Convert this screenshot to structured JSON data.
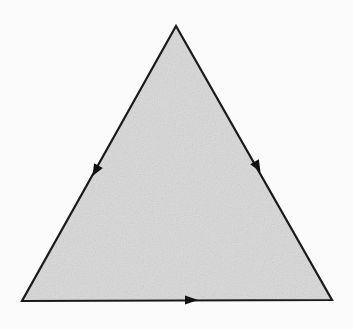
{
  "diagram": {
    "type": "triangle",
    "vertices": {
      "top": [
        176,
        26
      ],
      "bottom_left": [
        22,
        301
      ],
      "bottom_right": [
        332,
        300
      ]
    },
    "colors": {
      "background": "#fbfbfb",
      "fill": "#d9d9d9",
      "stroke": "#1a1a1a",
      "arrow": "#111111"
    },
    "arrows": [
      {
        "side": "left",
        "position": [
          96,
          170
        ],
        "direction": "down-left"
      },
      {
        "side": "right",
        "position": [
          257,
          166
        ],
        "direction": "down-right"
      },
      {
        "side": "bottom",
        "position": [
          190,
          300
        ],
        "direction": "right"
      }
    ]
  }
}
